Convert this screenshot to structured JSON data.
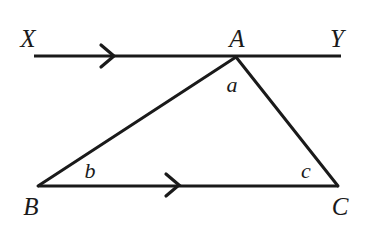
{
  "figure": {
    "background_color": "#ffffff",
    "stroke_color": "#1a1a1a",
    "text_color": "#1a1a1a"
  },
  "labels": {
    "x_point": "X",
    "y_point": "Y",
    "a_vertex": "A",
    "b_vertex": "B",
    "c_vertex": "C",
    "angle_a": "a",
    "angle_b": "b",
    "angle_c": "c"
  },
  "label_positions": {
    "x_point": {
      "x": 28,
      "y": 38
    },
    "y_point": {
      "x": 337,
      "y": 38
    },
    "a_vertex": {
      "x": 237,
      "y": 38
    },
    "b_vertex": {
      "x": 31,
      "y": 206
    },
    "c_vertex": {
      "x": 340,
      "y": 206
    },
    "angle_a": {
      "x": 232,
      "y": 85
    },
    "angle_b": {
      "x": 90,
      "y": 171
    },
    "angle_c": {
      "x": 306,
      "y": 171
    }
  },
  "geometry": {
    "points": {
      "X": {
        "x": 34,
        "y": 56
      },
      "Y": {
        "x": 341,
        "y": 56
      },
      "A": {
        "x": 236,
        "y": 57
      },
      "B": {
        "x": 38,
        "y": 186
      },
      "C": {
        "x": 338,
        "y": 186
      }
    },
    "segments": [
      {
        "name": "line-xy",
        "from": "X",
        "to": "Y",
        "width": 3.2
      },
      {
        "name": "side-ab",
        "from": "A",
        "to": "B",
        "width": 3.0
      },
      {
        "name": "side-ac",
        "from": "A",
        "to": "C",
        "width": 3.0
      },
      {
        "name": "side-bc",
        "from": "B",
        "to": "C",
        "width": 3.0
      }
    ],
    "arrow_markers": [
      {
        "name": "arrow-on-line-xy",
        "x": 112,
        "y": 56,
        "size": 11
      },
      {
        "name": "arrow-on-side-bc",
        "x": 177,
        "y": 185,
        "size": 11
      }
    ]
  }
}
